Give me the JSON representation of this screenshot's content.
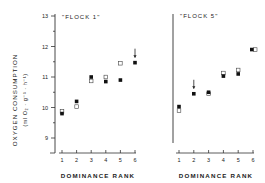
{
  "figure": {
    "ylabel_line1": "OXYGEN CONSUMPTION",
    "ylabel_line2": "(ml O₂ · g⁻¹ · h⁻¹)",
    "xlabel": "DOMINANCE RANK"
  },
  "chart_data": [
    {
      "type": "scatter",
      "title": "\"FLOCK 1\"",
      "xlabel": "DOMINANCE RANK",
      "ylabel": "OXYGEN CONSUMPTION (ml O2 · g-1 · h-1)",
      "x": [
        1,
        2,
        3,
        4,
        5,
        6
      ],
      "xticks": [
        "1",
        "2",
        "3",
        "4",
        "5",
        "6"
      ],
      "yticks": [
        "9",
        "10",
        "11",
        "12",
        "13"
      ],
      "ylim": [
        8.5,
        13
      ],
      "grid": false,
      "series": [
        {
          "name": "filled",
          "marker": "filled-square",
          "values": [
            9.8,
            10.2,
            11.0,
            10.85,
            10.9,
            11.47
          ]
        },
        {
          "name": "open",
          "marker": "open-square",
          "values": [
            9.87,
            10.03,
            10.87,
            11.0,
            11.45,
            null
          ]
        }
      ],
      "annotations": [
        {
          "type": "arrow-down",
          "x": 6,
          "note": "arrow marking rank 6"
        }
      ]
    },
    {
      "type": "scatter",
      "title": "\"FLOCK 5\"",
      "xlabel": "DOMINANCE RANK",
      "ylabel": "",
      "x": [
        1,
        2,
        3,
        4,
        5,
        6
      ],
      "xticks": [
        "1",
        "2",
        "3",
        "4",
        "5",
        "6"
      ],
      "ylim": [
        8.5,
        13
      ],
      "grid": false,
      "series": [
        {
          "name": "filled",
          "marker": "filled-square",
          "values": [
            10.03,
            10.45,
            10.5,
            11.03,
            11.1,
            11.9
          ]
        },
        {
          "name": "open",
          "marker": "open-square",
          "values": [
            9.9,
            null,
            10.45,
            11.13,
            11.23,
            11.9
          ]
        }
      ],
      "annotations": [
        {
          "type": "arrow-down",
          "x": 2,
          "note": "arrow marking rank 2"
        }
      ]
    }
  ]
}
